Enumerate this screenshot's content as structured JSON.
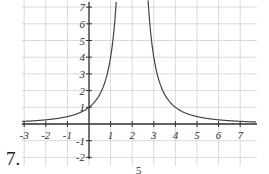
{
  "problem_number": "7.",
  "next_fragment": "5",
  "colors": {
    "grid": "#d9d9d9",
    "axis": "#333333",
    "curve": "#444444",
    "text": "#333333"
  },
  "chart_data": {
    "type": "line",
    "title": "",
    "xlabel": "",
    "ylabel": "",
    "function": "y = 4/(x-2)^2",
    "vertical_asymptote": 2,
    "horizontal_asymptote": 0,
    "xlim": [
      -3.1,
      7.7
    ],
    "ylim": [
      -2,
      7.4
    ],
    "grid": true,
    "x_ticks": [
      -3,
      -2,
      -1,
      1,
      2,
      3,
      4,
      5,
      6,
      7
    ],
    "y_ticks": [
      -2,
      -1,
      1,
      2,
      3,
      4,
      5,
      6,
      7
    ],
    "x_tick_labels": [
      "-3",
      "-2",
      "-1",
      "1",
      "2",
      "3",
      "4",
      "5",
      "6",
      "7"
    ],
    "y_tick_labels": [
      "-2",
      "-1",
      "1",
      "2",
      "3",
      "4",
      "5",
      "6",
      "7"
    ],
    "series": [
      {
        "name": "left branch",
        "x": [
          -3,
          -2,
          -1,
          0,
          0.5,
          1,
          1.265
        ],
        "y": [
          0.16,
          0.25,
          0.44,
          1,
          1.78,
          4,
          7.4
        ]
      },
      {
        "name": "right branch",
        "x": [
          2.735,
          3,
          3.5,
          4,
          5,
          6,
          7,
          7.7
        ],
        "y": [
          7.4,
          4,
          1.78,
          1,
          0.44,
          0.25,
          0.16,
          0.12
        ]
      }
    ]
  }
}
